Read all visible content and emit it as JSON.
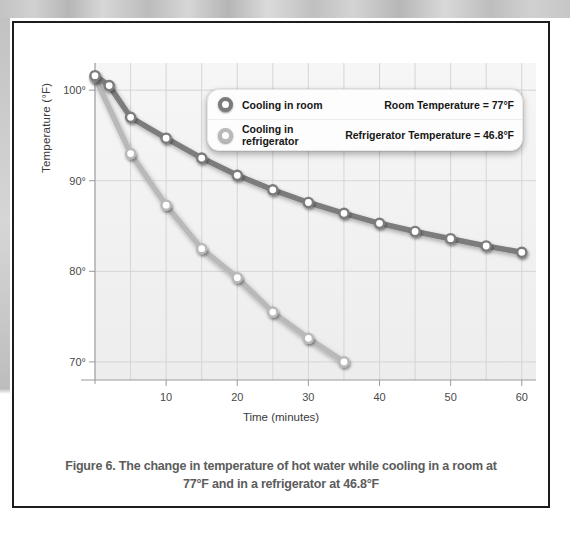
{
  "figure": {
    "caption_line1": "Figure 6. The change in temperature of hot water while cooling in a room at",
    "caption_line2": "77°F and in a refrigerator at 46.8°F"
  },
  "legend": {
    "rows": [
      {
        "marker": "circle-marker-room",
        "label": "Cooling in room",
        "value": "Room Temperature = 77°F"
      },
      {
        "marker": "circle-marker-refrigerator",
        "label": "Cooling in refrigerator",
        "value": "Refrigerator Temperature = 46.8°F"
      }
    ]
  },
  "colors": {
    "series_room": "#7b7b7b",
    "series_refrigerator": "#b9b9b9",
    "marker_fill": "#ffffff",
    "grid": "#d5d5d5",
    "axis": "#9a9a9a",
    "plot_bg": "#f2f2f2",
    "frame": "#1c1c1c",
    "caption_text": "#5c5c5c"
  },
  "chart_data": {
    "type": "line",
    "title": "",
    "xlabel": "Time (minutes)",
    "ylabel": "Temperature (°F)",
    "xlim": [
      0,
      62
    ],
    "ylim": [
      68,
      103
    ],
    "xticks": [
      10,
      20,
      30,
      40,
      50,
      60
    ],
    "xtick_labels": [
      "10",
      "20",
      "30",
      "40",
      "50",
      "60"
    ],
    "yticks": [
      70,
      80,
      90,
      100
    ],
    "ytick_labels": [
      "70°",
      "80°",
      "90°",
      "100°"
    ],
    "grid": true,
    "grid_minor_x_step": 5,
    "legend_position": "top-right-inside",
    "series": [
      {
        "name": "Cooling in room",
        "color": "#7b7b7b",
        "x": [
          0,
          2,
          5,
          10,
          15,
          20,
          25,
          30,
          35,
          40,
          45,
          50,
          55,
          60
        ],
        "values": [
          101.6,
          100.5,
          97.0,
          94.7,
          92.5,
          90.6,
          89.0,
          87.6,
          86.4,
          85.3,
          84.4,
          83.6,
          82.8,
          82.1
        ]
      },
      {
        "name": "Cooling in refrigerator",
        "color": "#b9b9b9",
        "x": [
          0,
          5,
          10,
          15,
          20,
          25,
          30,
          35
        ],
        "values": [
          101.4,
          93.0,
          87.3,
          82.5,
          79.3,
          75.5,
          72.6,
          70.0
        ]
      }
    ]
  }
}
